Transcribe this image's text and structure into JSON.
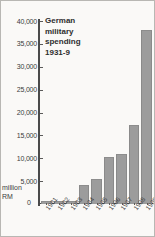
{
  "chart_data": {
    "type": "bar",
    "title_lines": [
      "German",
      "military",
      "spending",
      "1931-9"
    ],
    "xlabel": "",
    "ylabel": "million RM",
    "ylim": [
      0,
      40000
    ],
    "ytick_labels": [
      "40,000",
      "35,000",
      "30,000",
      "25,000",
      "20,000",
      "15,000",
      "10,000",
      "5,000"
    ],
    "ytick_values": [
      40000,
      35000,
      30000,
      25000,
      20000,
      15000,
      10000,
      5000
    ],
    "zero_label": "0",
    "unit_lines": [
      "million",
      "RM"
    ],
    "grid": false,
    "legend": "none",
    "categories": [
      "1931",
      "1932",
      "1933",
      "1934",
      "1935",
      "1936",
      "1937",
      "1938",
      "1939"
    ],
    "values": [
      700,
      700,
      750,
      4200,
      5500,
      10200,
      10900,
      17200,
      38000
    ],
    "bar_color": "#9c9c9c",
    "axis_color": "#4a4a4a",
    "background_color": "#faf9f7",
    "border_color": "#b8b7b3",
    "text_color": "#3c3c3c"
  }
}
